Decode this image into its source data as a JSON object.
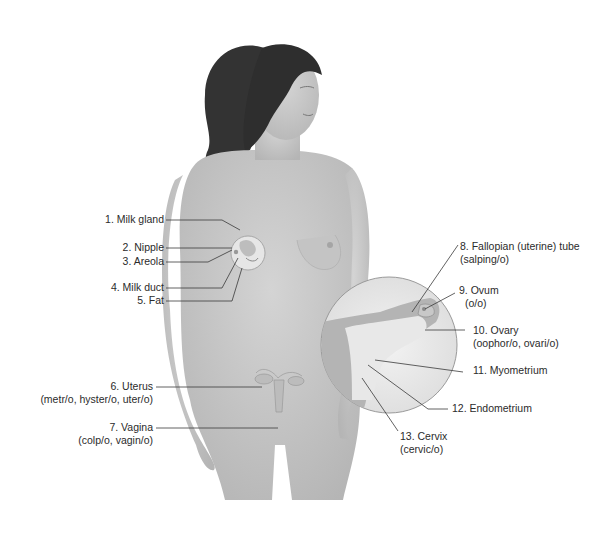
{
  "figure": {
    "colors": {
      "background": "#ffffff",
      "skin": "#c9c9c9",
      "skin_shadow": "#a9a9a9",
      "hair": "#2e2e2e",
      "leader_line": "#3a3a3a",
      "text": "#2b2b2b",
      "inset_circle": "#9a9a9a"
    }
  },
  "labels": [
    {
      "id": 1,
      "title": "1. Milk gland",
      "combining": ""
    },
    {
      "id": 2,
      "title": "2. Nipple",
      "combining": ""
    },
    {
      "id": 3,
      "title": "3. Areola",
      "combining": ""
    },
    {
      "id": 4,
      "title": "4. Milk duct",
      "combining": ""
    },
    {
      "id": 5,
      "title": "5. Fat",
      "combining": ""
    },
    {
      "id": 6,
      "title": "6. Uterus",
      "combining": "(metr/o, hyster/o, uter/o)"
    },
    {
      "id": 7,
      "title": "7. Vagina",
      "combining": "(colp/o, vagin/o)"
    },
    {
      "id": 8,
      "title": "8. Fallopian (uterine) tube",
      "combining": "(salping/o)"
    },
    {
      "id": 9,
      "title": "9. Ovum",
      "combining": "(o/o)"
    },
    {
      "id": 10,
      "title": "10. Ovary",
      "combining": "(oophor/o, ovari/o)"
    },
    {
      "id": 11,
      "title": "11. Myometrium",
      "combining": ""
    },
    {
      "id": 12,
      "title": "12. Endometrium",
      "combining": ""
    },
    {
      "id": 13,
      "title": "13. Cervix",
      "combining": "(cervic/o)"
    }
  ]
}
